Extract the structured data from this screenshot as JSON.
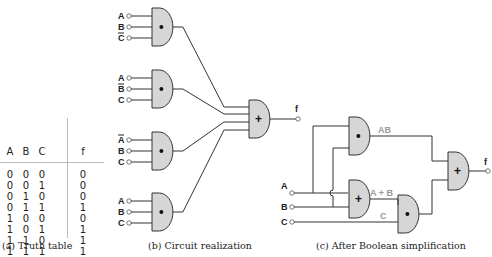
{
  "truth_table": {
    "headers": [
      "A",
      "B",
      "C",
      "f"
    ],
    "rows": [
      [
        "0",
        "0",
        "0",
        "0"
      ],
      [
        "0",
        "0",
        "1",
        "0"
      ],
      [
        "0",
        "1",
        "0",
        "0"
      ],
      [
        "0",
        "1",
        "1",
        "1"
      ],
      [
        "1",
        "0",
        "0",
        "0"
      ],
      [
        "1",
        "0",
        "1",
        "1"
      ],
      [
        "1",
        "1",
        "0",
        "1"
      ],
      [
        "1",
        "1",
        "1",
        "1"
      ]
    ],
    "caption": "(a) Truth table"
  },
  "circuit": {
    "caption": "(b) Circuit realization",
    "gates": [
      {
        "inputs": [
          "A",
          "B",
          "C"
        ],
        "inverted": [
          false,
          false,
          true
        ]
      },
      {
        "inputs": [
          "A",
          "B",
          "C"
        ],
        "inverted": [
          false,
          true,
          false
        ]
      },
      {
        "inputs": [
          "A",
          "B",
          "C"
        ],
        "inverted": [
          true,
          false,
          false
        ]
      },
      {
        "inputs": [
          "A",
          "B",
          "C"
        ],
        "inverted": [
          false,
          false,
          false
        ]
      }
    ],
    "and_symbol": "•",
    "or_symbol": "+",
    "output": "f"
  },
  "simplified": {
    "caption": "(c) After Boolean simplification",
    "inputs": [
      "A",
      "B",
      "C"
    ],
    "wire_labels": {
      "ab": "AB",
      "a_plus_b": "A + B",
      "c": "C"
    },
    "output": "f"
  },
  "colors": {
    "gate_fill": "#d6d6d6",
    "line": "#333333",
    "label_gray": "#999999"
  }
}
